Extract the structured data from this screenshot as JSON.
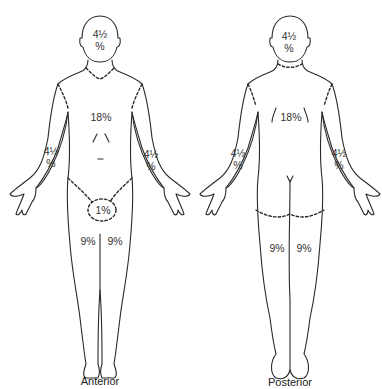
{
  "diagram": {
    "figures": [
      {
        "view": "Anterior",
        "regions": [
          {
            "name": "head",
            "value": "4½\n%"
          },
          {
            "name": "trunk",
            "value": "18%"
          },
          {
            "name": "right-arm",
            "value": "4½\n%"
          },
          {
            "name": "left-arm",
            "value": "4½\n%"
          },
          {
            "name": "genitals",
            "value": "1%"
          },
          {
            "name": "right-leg",
            "value": "9%"
          },
          {
            "name": "left-leg",
            "value": "9%"
          }
        ]
      },
      {
        "view": "Posterior",
        "regions": [
          {
            "name": "head",
            "value": "4½\n%"
          },
          {
            "name": "trunk",
            "value": "18%"
          },
          {
            "name": "left-arm",
            "value": "4½\n%"
          },
          {
            "name": "right-arm",
            "value": "4½\n%"
          },
          {
            "name": "left-leg",
            "value": "9%"
          },
          {
            "name": "right-leg",
            "value": "9%"
          }
        ]
      }
    ],
    "line_color": "#2a2a2a",
    "text_color": "#333333"
  }
}
